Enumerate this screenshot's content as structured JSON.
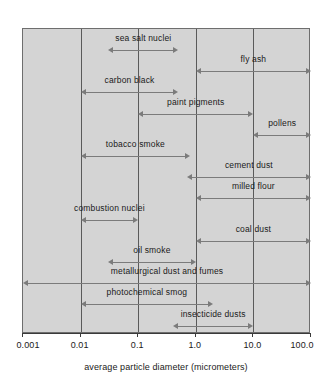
{
  "chart_data": {
    "type": "bar",
    "orientation": "horizontal",
    "scale": "log",
    "title": "",
    "subtitle": "",
    "xlabel": "average particle diameter (micrometers)",
    "ylabel": "",
    "xlim": [
      0.001,
      100.0
    ],
    "grid": true,
    "legend": null,
    "tick_labels": [
      "0.001",
      "0.01",
      "0.1",
      "1.0",
      "10.0",
      "100.0"
    ],
    "tick_values": [
      0.001,
      0.01,
      0.1,
      1.0,
      10.0,
      100.0
    ],
    "categories": [
      "sea salt nuclei",
      "fly ash",
      "carbon black",
      "paint pigments",
      "pollens",
      "tobacco smoke",
      "cement dust",
      "milled flour",
      "combustion nuclei",
      "coal dust",
      "oil smoke",
      "metallurgical dust and fumes",
      "photochemical smog",
      "insecticide dusts"
    ],
    "ranges": [
      {
        "label": "sea salt nuclei",
        "min": 0.03,
        "max": 0.5
      },
      {
        "label": "fly ash",
        "min": 1.0,
        "max": 100.0
      },
      {
        "label": "carbon black",
        "min": 0.01,
        "max": 0.5
      },
      {
        "label": "paint pigments",
        "min": 0.1,
        "max": 10.0
      },
      {
        "label": "pollens",
        "min": 10.0,
        "max": 100.0
      },
      {
        "label": "tobacco smoke",
        "min": 0.01,
        "max": 0.8
      },
      {
        "label": "cement dust",
        "min": 0.7,
        "max": 100.0
      },
      {
        "label": "milled flour",
        "min": 1.0,
        "max": 100.0
      },
      {
        "label": "combustion nuclei",
        "min": 0.01,
        "max": 0.1
      },
      {
        "label": "coal dust",
        "min": 1.0,
        "max": 100.0
      },
      {
        "label": "oil smoke",
        "min": 0.03,
        "max": 1.0
      },
      {
        "label": "metallurgical dust and fumes",
        "min": 0.001,
        "max": 100.0
      },
      {
        "label": "photochemical smog",
        "min": 0.01,
        "max": 2.0
      },
      {
        "label": "insecticide dusts",
        "min": 0.4,
        "max": 10.0
      }
    ]
  },
  "colors": {
    "plot_background": "#d4d4d4",
    "gridline": "#5a5a5a",
    "arrow": "#7b7b7b",
    "text": "#1a1a1a",
    "axis": "#3a3a3a",
    "page_background": "#ffffff"
  }
}
